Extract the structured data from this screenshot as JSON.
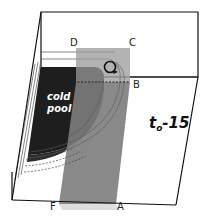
{
  "diagram": {
    "time_label": {
      "main": "t",
      "subscript": "o",
      "suffix": "-15"
    },
    "region_label": {
      "line1": "cold",
      "line2": "pool"
    },
    "corner_labels": {
      "A": "A",
      "B": "B",
      "C": "C",
      "D": "D",
      "E": "E",
      "F": "F"
    },
    "colors": {
      "box_edge": "#111111",
      "cold_pool": "#222222",
      "cold_pool_edge": "#444444",
      "vertical_plane": "#8a8a8a",
      "plane_top": "#a8a8a8",
      "background": "#ffffff"
    }
  }
}
